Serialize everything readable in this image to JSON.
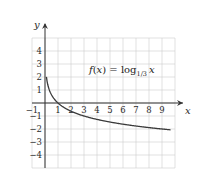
{
  "chart_data": {
    "type": "line",
    "title": "",
    "function_label": {
      "prefix": "f(x) = log",
      "base": "1/3",
      "arg": "x"
    },
    "xlabel": "x",
    "ylabel": "y",
    "xlim": [
      -1,
      10
    ],
    "ylim": [
      -5,
      5
    ],
    "grid": true,
    "x_ticks": [
      "−1",
      "1",
      "2",
      "3",
      "4",
      "5",
      "6",
      "7",
      "8",
      "9"
    ],
    "x_tick_values": [
      -1,
      1,
      2,
      3,
      4,
      5,
      6,
      7,
      8,
      9
    ],
    "y_ticks": [
      "4",
      "3",
      "2",
      "1",
      "−1",
      "−2",
      "−3",
      "−4"
    ],
    "y_tick_values": [
      4,
      3,
      2,
      1,
      -1,
      -2,
      -3,
      -4
    ],
    "series": [
      {
        "name": "f(x) = log_{1/3} x",
        "x": [
          0.11,
          0.2,
          0.333,
          0.5,
          1,
          2,
          3,
          4,
          5,
          6,
          7,
          8,
          9,
          10
        ],
        "values": [
          2.0,
          1.46,
          1.0,
          0.63,
          0,
          -0.63,
          -1.0,
          -1.26,
          -1.46,
          -1.63,
          -1.77,
          -1.89,
          -2.0,
          -2.1
        ]
      }
    ],
    "colors": {
      "curve": "#3a3a3a",
      "axis": "#333333",
      "grid": "#cfcfcf"
    }
  }
}
